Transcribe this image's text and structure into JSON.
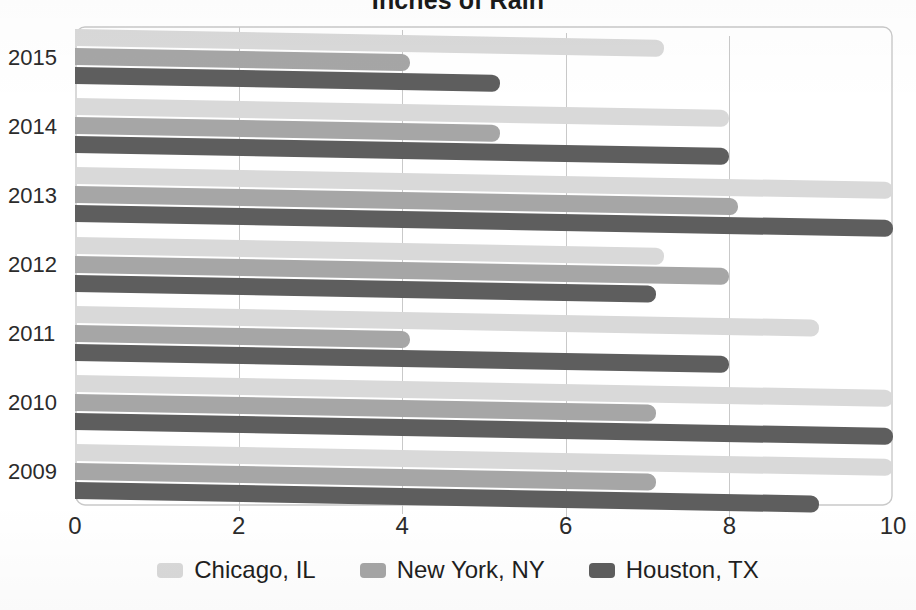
{
  "chart_data": {
    "type": "bar",
    "orientation": "horizontal",
    "title": "Inches of Rain",
    "xlabel": "",
    "ylabel": "",
    "xlim": [
      0,
      10
    ],
    "xticks": [
      "0",
      "2",
      "4",
      "6",
      "8",
      "10"
    ],
    "categories": [
      "2015",
      "2014",
      "2013",
      "2012",
      "2011",
      "2010",
      "2009"
    ],
    "grid": true,
    "legend_position": "bottom",
    "series": [
      {
        "name": "Chicago, IL",
        "color": "#d9d9d9",
        "values": [
          7.2,
          8.0,
          10.0,
          7.2,
          9.1,
          10.0,
          10.0
        ]
      },
      {
        "name": "New York, NY",
        "color": "#a6a6a6",
        "values": [
          4.1,
          5.2,
          8.1,
          8.0,
          4.1,
          7.1,
          7.1
        ]
      },
      {
        "name": "Houston, TX",
        "color": "#5e5e5e",
        "values": [
          5.2,
          8.0,
          10.0,
          7.1,
          8.0,
          10.0,
          9.1
        ]
      }
    ]
  },
  "legend": {
    "items": [
      {
        "label": "Chicago, IL",
        "swatch": "chicago"
      },
      {
        "label": "New York, NY",
        "swatch": "newyork"
      },
      {
        "label": "Houston, TX",
        "swatch": "houston"
      }
    ]
  }
}
